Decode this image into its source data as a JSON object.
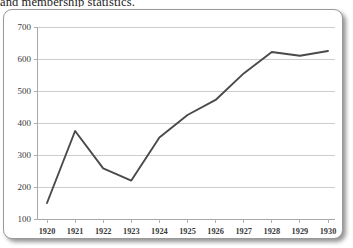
{
  "document": {
    "clipped_text_above_figure": "and membership statistics."
  },
  "figure": {
    "frame_border_color": "#9a9a9a",
    "line_color": "#4a4a4a",
    "gridline_color": "#cdcdcd",
    "axis_color": "#a8a8a8"
  },
  "chart_data": {
    "type": "line",
    "title": "",
    "subtitle": "",
    "xlabel": "",
    "ylabel": "",
    "categories": [
      "1920",
      "1921",
      "1922",
      "1923",
      "1924",
      "1925",
      "1926",
      "1927",
      "1928",
      "1929",
      "1930"
    ],
    "values": [
      150,
      375,
      258,
      220,
      355,
      425,
      472,
      555,
      622,
      610,
      625
    ],
    "series": [
      {
        "name": "Membership",
        "values": [
          150,
          375,
          258,
          220,
          355,
          425,
          472,
          555,
          622,
          610,
          625
        ]
      }
    ],
    "ylim": [
      100,
      700
    ],
    "ytick_labels": [
      "700",
      "600",
      "500",
      "400",
      "300",
      "200",
      "100"
    ],
    "ytick_values": [
      700,
      600,
      500,
      400,
      300,
      200,
      100
    ],
    "xtick_labels": [
      "1920",
      "1921",
      "1922",
      "1923",
      "1924",
      "1925",
      "1926",
      "1927",
      "1928",
      "1929",
      "1930"
    ],
    "grid": true,
    "grid_axis": "y",
    "legend": false,
    "legend_position": "none",
    "markers": false,
    "annotations": []
  }
}
